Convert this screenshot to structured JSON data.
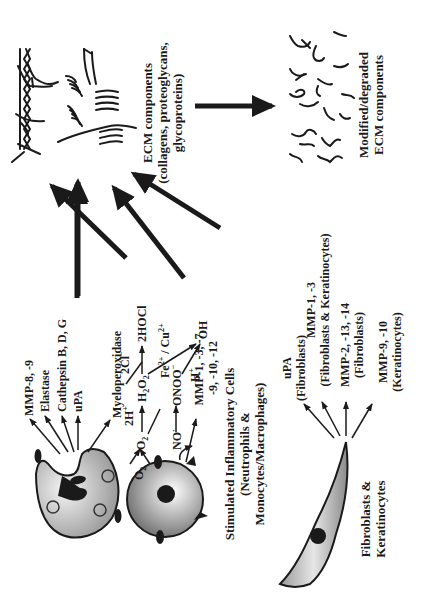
{
  "diagram": {
    "ecm_intact": {
      "label_line1": "ECM components",
      "label_line2": "(collagens, proteoglycans,",
      "label_line3": "glycoproteins)"
    },
    "ecm_degraded": {
      "label_line1": "Modified/degraded",
      "label_line2": "ECM components"
    },
    "inflammatory_cells": {
      "label_line1": "Stimulated Inflammatory Cells",
      "label_line2": "(Neutrophils &",
      "label_line3": "Monocytes/Macrophages)",
      "neutrophil_products": [
        "MMP-8, -9",
        "Elastase",
        "Cathepsin B, D, G",
        "uPA",
        "Myeloperoxidase"
      ],
      "macrophage_products_line1": "MMP-1, -3, -7,",
      "macrophage_products_line2": "-9, -10, -12"
    },
    "reactions": {
      "o2": "O",
      "o2_sub": "2",
      "superoxide": "O",
      "superoxide_sub": "2",
      "superoxide_sup": "·−",
      "plus": " + ",
      "no": "NO",
      "no_sup": "·",
      "two_h": "2H",
      "two_h_sup": "+",
      "h2o2": "H",
      "h2o2_sub1": "2",
      "h2o2_mid": "O",
      "h2o2_sub2": "2",
      "two_cl": "2Cl",
      "two_cl_sup": "−",
      "hocl": "2HOCl",
      "onoo": "ONOO",
      "onoo_sup": "−",
      "h_plus": "H",
      "h_plus_sup": "+",
      "fe_cu": "Fe",
      "fe_sup": "2+",
      "slash_cu": " / Cu",
      "cu_sup": "2+",
      "oh": "OH",
      "oh_sup": "·"
    },
    "fibroblasts": {
      "label_line1": "Fibroblasts &",
      "label_line2": "Keratinocytes",
      "products": [
        {
          "line1": "uPA",
          "line2": "(Fibroblasts)"
        },
        {
          "line1": "MMP-1, -3",
          "line2": "(Fibroblasts & Keratinocytes)"
        },
        {
          "line1": "MMP-2, -13, -14",
          "line2": "(Fibroblasts)"
        },
        {
          "line1": "MMP-9, -10",
          "line2": "(Keratinocytes)"
        }
      ]
    },
    "colors": {
      "ink": "#1a1a1a",
      "cell_fill_light": "#f2f2f2",
      "cell_fill_dark": "#8a8a8a",
      "background": "#ffffff"
    }
  }
}
